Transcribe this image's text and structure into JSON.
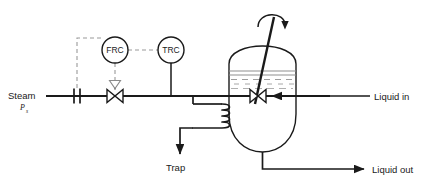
{
  "diagram": {
    "type": "process-flow-diagram",
    "colors": {
      "line": "#1a1a1a",
      "signal": "#7a7a7a",
      "liquid": "#8c8c8c",
      "background": "#ffffff"
    },
    "labels": {
      "steam": "Steam",
      "steam_subscript": "Ps",
      "steam_sub_base": "P",
      "steam_sub_index": "s",
      "trap": "Trap",
      "liquid_in": "Liquid in",
      "liquid_out": "Liquid out"
    },
    "instruments": [
      {
        "tag": "FRC",
        "name": "flow-recorder-controller",
        "cx": 115,
        "cy": 50,
        "r": 13
      },
      {
        "tag": "TRC",
        "name": "temperature-recorder-controller",
        "cx": 171,
        "cy": 50,
        "r": 13
      }
    ],
    "equipment": {
      "vessel_name": "agitated-vessel",
      "agitator_name": "agitator",
      "coil_name": "heating-coil",
      "orifice_name": "orifice-flow-element",
      "steam_valve_name": "steam-control-valve",
      "liquid_in_valve_name": "liquid-inlet-valve"
    }
  }
}
